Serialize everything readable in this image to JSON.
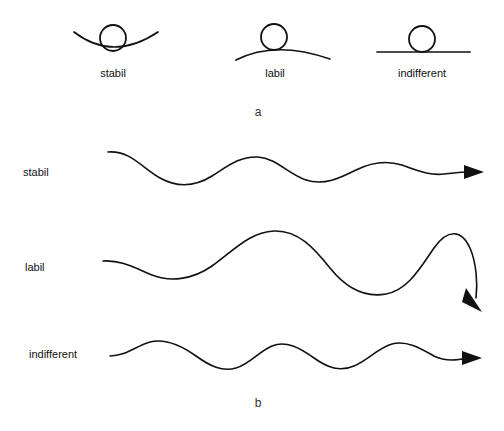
{
  "figure": {
    "panels": [
      {
        "letter": "a",
        "letter_x": 258,
        "letter_y": 106,
        "items": [
          {
            "id": "stable",
            "label": "stabil",
            "label_x": 113,
            "label_y": 68,
            "surface_shape": "concave-valley",
            "ball_cx": 113,
            "ball_cy": 38,
            "ball_r": 13
          },
          {
            "id": "unstable",
            "label": "labil",
            "label_x": 275,
            "label_y": 68,
            "surface_shape": "convex-hill",
            "ball_cx": 274,
            "ball_cy": 37,
            "ball_r": 13
          },
          {
            "id": "neutral",
            "label": "indifferent",
            "label_x": 422,
            "label_y": 68,
            "surface_shape": "flat-line",
            "ball_cx": 422,
            "ball_cy": 39,
            "ball_r": 13
          }
        ]
      },
      {
        "letter": "b",
        "letter_x": 258,
        "letter_y": 397,
        "items": [
          {
            "id": "stable-wave",
            "label": "stabil",
            "label_x": 23,
            "label_y": 167,
            "wave_type": "damped",
            "arrow_direction": "right"
          },
          {
            "id": "unstable-wave",
            "label": "labil",
            "label_x": 25,
            "label_y": 262,
            "wave_type": "growing",
            "arrow_direction": "down-right"
          },
          {
            "id": "neutral-wave",
            "label": "indifferent",
            "label_x": 29,
            "label_y": 349,
            "wave_type": "constant",
            "arrow_direction": "right"
          }
        ]
      }
    ],
    "colors": {
      "ink": "#111111",
      "background": "#ffffff"
    }
  }
}
